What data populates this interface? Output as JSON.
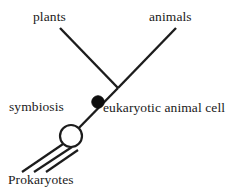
{
  "diagram": {
    "type": "phylogenetic-branch-diagram",
    "background_color": "#ffffff",
    "line_color": "#1c1c1c",
    "labels": {
      "plants": "plants",
      "animals": "animals",
      "symbiosis": "symbiosis",
      "eukaryotic_animal_cell": "eukaryotic animal cell",
      "prokaryotes": "Prokaryotes"
    },
    "nodes": [
      {
        "id": "branch-junction",
        "name": "plants-animals-branch-point",
        "x": 118,
        "y": 88,
        "style": "none"
      },
      {
        "id": "eukaryote-node",
        "name": "eukaryotic-animal-cell-node",
        "x": 98,
        "y": 102,
        "radius": 6.2,
        "style": "filled",
        "fill": "#0d0d0d"
      },
      {
        "id": "symbiosis-node",
        "name": "symbiosis-event-node",
        "x": 71,
        "y": 136,
        "radius": 11,
        "style": "open",
        "fill": "#ffffff"
      }
    ],
    "edges": [
      {
        "id": "plants-branch",
        "name": "plants-branch-line",
        "x1": 60,
        "y1": 28,
        "x2": 118,
        "y2": 88
      },
      {
        "id": "animals-branch",
        "name": "animals-branch-line",
        "x1": 176,
        "y1": 28,
        "x2": 118,
        "y2": 88
      },
      {
        "id": "eukaryote-stem",
        "name": "eukaryote-stem-line",
        "x1": 118,
        "y1": 88,
        "x2": 71,
        "y2": 136
      },
      {
        "id": "prokaryote-line-1",
        "name": "prokaryote-lineage-line-1",
        "x1": 66,
        "y1": 142,
        "x2": 22,
        "y2": 172
      },
      {
        "id": "prokaryote-line-2",
        "name": "prokaryote-lineage-line-2",
        "x1": 71,
        "y1": 147,
        "x2": 34,
        "y2": 172
      },
      {
        "id": "prokaryote-line-3",
        "name": "prokaryote-lineage-line-3",
        "x1": 77,
        "y1": 150,
        "x2": 46,
        "y2": 172
      }
    ]
  }
}
